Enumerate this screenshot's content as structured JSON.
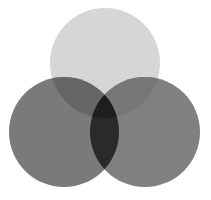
{
  "diagram": {
    "type": "venn-3",
    "background": "#ffffff",
    "circles": [
      {
        "id": "top",
        "cx": 105,
        "cy": 63,
        "r": 55,
        "fill": "#d6d6d6"
      },
      {
        "id": "left",
        "cx": 64,
        "cy": 132,
        "r": 55,
        "fill": "#7a7a7a"
      },
      {
        "id": "right",
        "cx": 145,
        "cy": 132,
        "r": 55,
        "fill": "#808080"
      }
    ],
    "overlaps": {
      "top_left": "#666666",
      "top_right": "#777777",
      "left_right": "#2a2a2a",
      "all": "#1e1e1e"
    }
  }
}
